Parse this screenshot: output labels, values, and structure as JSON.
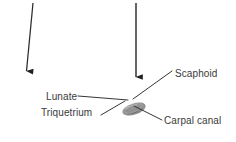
{
  "figure": {
    "background_color": "#ffffff",
    "width": 236,
    "height": 142,
    "label_color": "#3a3a3a",
    "line_color": "#2b2b2b",
    "ellipse_color": "#9a9a9a",
    "ellipse_shadow_color": "#6e6e6e",
    "labels": {
      "scaphoid": "Scaphoid",
      "lunate": "Lunate",
      "triquetrium": "Triquetrium",
      "carpal_canal": "Carpal canal"
    },
    "annotations": {
      "arrows": [
        {
          "name": "left-pointer-arrow",
          "direction": "down",
          "x1": 33,
          "y1": 3,
          "x2": 26.5,
          "y2": 71
        },
        {
          "name": "right-pointer-arrow",
          "direction": "down",
          "x1": 136,
          "y1": 3,
          "x2": 136,
          "y2": 77
        }
      ],
      "leader_lines": [
        {
          "name": "scaphoid-leader",
          "x1": 172,
          "y1": 71,
          "x2": 133,
          "y2": 99
        },
        {
          "name": "lunate-leader",
          "x1": 78,
          "y1": 96,
          "x2": 128,
          "y2": 100
        },
        {
          "name": "triquetrium-leader",
          "x1": 101,
          "y1": 115,
          "x2": 125,
          "y2": 101
        },
        {
          "name": "carpal-canal-leader",
          "x1": 162,
          "y1": 120,
          "x2": 134,
          "y2": 106
        }
      ],
      "structure": {
        "name": "carpal-canal-ellipse",
        "cx": 134,
        "cy": 109,
        "rx": 12,
        "ry": 5.5,
        "rotation": -18
      }
    }
  }
}
